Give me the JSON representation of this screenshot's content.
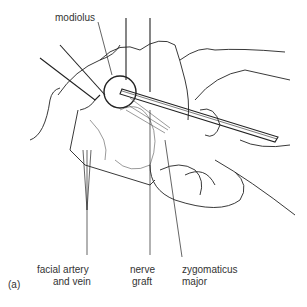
{
  "figure": {
    "panel_label": "(a)",
    "labels": {
      "modiolus": "modiolus",
      "facial_artery_line1": "facial artery",
      "facial_artery_line2": "and vein",
      "nerve_graft_line1": "nerve",
      "nerve_graft_line2": "graft",
      "zygomaticus_line1": "zygomaticus",
      "zygomaticus_line2": "major"
    }
  }
}
